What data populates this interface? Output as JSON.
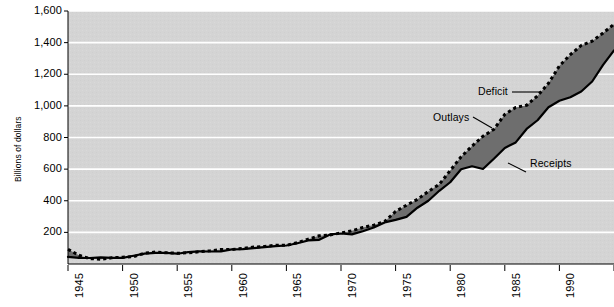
{
  "chart_data": {
    "type": "area",
    "title": "",
    "subtitle": "",
    "xlabel": "",
    "ylabel": "Billions of dollars",
    "xlim": [
      1945,
      1995
    ],
    "ylim": [
      0,
      1600
    ],
    "grid": true,
    "grid_axis": "y",
    "legend": "annotations-inline",
    "plot_background": "#d4d4d4",
    "fill_color": "#6e6e6e",
    "line_color": "#000000",
    "gridline_color": "#ffffff",
    "y_ticks": [
      {
        "value": 1600,
        "label": "1,600"
      },
      {
        "value": 1400,
        "label": "1,400"
      },
      {
        "value": 1200,
        "label": "1,200"
      },
      {
        "value": 1000,
        "label": "1,000"
      },
      {
        "value": 800,
        "label": "800"
      },
      {
        "value": 600,
        "label": "600"
      },
      {
        "value": 400,
        "label": "400"
      },
      {
        "value": 200,
        "label": "200"
      }
    ],
    "x_ticks": [
      {
        "value": 1945,
        "label": "1945"
      },
      {
        "value": 1950,
        "label": "1950"
      },
      {
        "value": 1955,
        "label": "1955"
      },
      {
        "value": 1960,
        "label": "1960"
      },
      {
        "value": 1965,
        "label": "1965"
      },
      {
        "value": 1970,
        "label": "1970"
      },
      {
        "value": 1975,
        "label": "1975"
      },
      {
        "value": 1980,
        "label": "1980"
      },
      {
        "value": 1985,
        "label": "1985"
      },
      {
        "value": 1990,
        "label": "1990"
      },
      {
        "value": 1995,
        "label": "1995"
      }
    ],
    "annotations": [
      {
        "name": "deficit",
        "label": "Deficit"
      },
      {
        "name": "outlays",
        "label": "Outlays"
      },
      {
        "name": "receipts",
        "label": "Receipts"
      }
    ],
    "x": [
      1945,
      1946,
      1947,
      1948,
      1949,
      1950,
      1951,
      1952,
      1953,
      1954,
      1955,
      1956,
      1957,
      1958,
      1959,
      1960,
      1961,
      1962,
      1963,
      1964,
      1965,
      1966,
      1967,
      1968,
      1969,
      1970,
      1971,
      1972,
      1973,
      1974,
      1975,
      1976,
      1977,
      1978,
      1979,
      1980,
      1981,
      1982,
      1983,
      1984,
      1985,
      1986,
      1987,
      1988,
      1989,
      1990,
      1991,
      1992,
      1993,
      1994,
      1995
    ],
    "series": [
      {
        "name": "Outlays",
        "style": "dashed",
        "values": [
          93,
          55,
          34,
          30,
          39,
          43,
          46,
          68,
          76,
          71,
          68,
          71,
          77,
          83,
          92,
          92,
          98,
          107,
          111,
          119,
          118,
          135,
          157,
          178,
          184,
          196,
          210,
          231,
          246,
          269,
          332,
          372,
          409,
          459,
          504,
          591,
          678,
          746,
          808,
          852,
          946,
          990,
          1004,
          1064,
          1143,
          1253,
          1324,
          1382,
          1409,
          1461,
          1516
        ]
      },
      {
        "name": "Receipts",
        "style": "solid",
        "values": [
          45,
          39,
          38,
          42,
          39,
          39,
          52,
          66,
          70,
          70,
          65,
          75,
          80,
          79,
          79,
          92,
          94,
          100,
          107,
          113,
          117,
          131,
          149,
          153,
          187,
          193,
          187,
          207,
          231,
          263,
          279,
          298,
          356,
          400,
          463,
          517,
          599,
          618,
          601,
          666,
          734,
          769,
          854,
          909,
          991,
          1032,
          1055,
          1091,
          1154,
          1259,
          1351
        ]
      }
    ]
  }
}
